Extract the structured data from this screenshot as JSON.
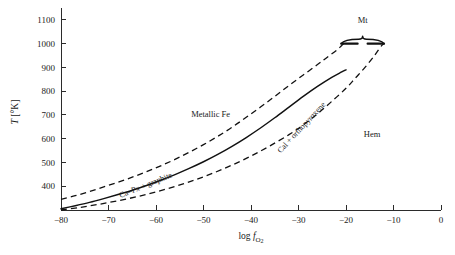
{
  "chart_data": {
    "type": "line",
    "title": "",
    "xlabel": "log f O2",
    "xlabel_parts": {
      "prefix": "log ",
      "italic": "f",
      "sub": "O",
      "sub2": "2"
    },
    "ylabel": "T [°K]",
    "ylabel_parts": {
      "italic": "T",
      "rest": " [°K]"
    },
    "xlim": [
      -80,
      0
    ],
    "ylim": [
      300,
      1150
    ],
    "grid": false,
    "legend_position": "none",
    "xticks": [
      -80,
      -70,
      -60,
      -50,
      -40,
      -30,
      -20,
      -10,
      0
    ],
    "xtick_labels": [
      "−80",
      "−70",
      "−60",
      "−50",
      "−40",
      "−30",
      "−20",
      "−10",
      "0"
    ],
    "yticks": [
      400,
      500,
      600,
      700,
      800,
      900,
      1000,
      1100
    ],
    "ytick_labels": [
      "400",
      "500",
      "600",
      "700",
      "800",
      "900",
      "1000",
      "1100"
    ],
    "series": [
      {
        "name": "upper-boundary",
        "style": "dashed",
        "points": [
          [
            -80,
            345
          ],
          [
            -77,
            360
          ],
          [
            -74,
            378
          ],
          [
            -71,
            397
          ],
          [
            -68,
            417
          ],
          [
            -65,
            438
          ],
          [
            -62,
            461
          ],
          [
            -59,
            486
          ],
          [
            -56,
            513
          ],
          [
            -53,
            543
          ],
          [
            -50,
            575
          ],
          [
            -47,
            610
          ],
          [
            -44,
            648
          ],
          [
            -41,
            690
          ],
          [
            -38,
            733
          ],
          [
            -35,
            778
          ],
          [
            -32,
            824
          ],
          [
            -29,
            868
          ],
          [
            -26,
            912
          ],
          [
            -24,
            942
          ],
          [
            -22,
            972
          ],
          [
            -21,
            990
          ],
          [
            -20.5,
            1000
          ]
        ]
      },
      {
        "name": "center-curve",
        "style": "solid",
        "points": [
          [
            -80,
            305
          ],
          [
            -77,
            318
          ],
          [
            -74,
            332
          ],
          [
            -71,
            348
          ],
          [
            -68,
            365
          ],
          [
            -65,
            383
          ],
          [
            -62,
            403
          ],
          [
            -59,
            425
          ],
          [
            -56,
            449
          ],
          [
            -53,
            475
          ],
          [
            -50,
            503
          ],
          [
            -47,
            534
          ],
          [
            -44,
            568
          ],
          [
            -41,
            605
          ],
          [
            -38,
            645
          ],
          [
            -35,
            688
          ],
          [
            -32,
            733
          ],
          [
            -29,
            778
          ],
          [
            -26,
            820
          ],
          [
            -23,
            858
          ],
          [
            -21,
            880
          ],
          [
            -20,
            890
          ]
        ]
      },
      {
        "name": "lower-boundary",
        "style": "dashed",
        "points": [
          [
            -80,
            300
          ],
          [
            -76,
            311
          ],
          [
            -72,
            324
          ],
          [
            -68,
            339
          ],
          [
            -64,
            356
          ],
          [
            -60,
            376
          ],
          [
            -56,
            399
          ],
          [
            -52,
            425
          ],
          [
            -48,
            455
          ],
          [
            -44,
            489
          ],
          [
            -40,
            527
          ],
          [
            -36,
            570
          ],
          [
            -32,
            617
          ],
          [
            -29,
            658
          ],
          [
            -26,
            705
          ],
          [
            -23,
            757
          ],
          [
            -20,
            812
          ],
          [
            -18,
            856
          ],
          [
            -16,
            900
          ],
          [
            -14,
            950
          ],
          [
            -12.5,
            992
          ],
          [
            -12,
            1000
          ]
        ]
      }
    ],
    "annotations": [
      {
        "name": "metallic-fe",
        "text": "Metallic Fe",
        "x": -48.5,
        "y": 690,
        "rotation": 0
      },
      {
        "name": "hem",
        "text": "Hem",
        "x": -14.5,
        "y": 607,
        "rotation": 0
      },
      {
        "name": "mt",
        "text": "Mt",
        "x": -16.5,
        "y": 1085,
        "rotation": 0
      },
      {
        "name": "ca-px-graphite",
        "text": "Ca–Px + graphite",
        "x": -62,
        "y": 395,
        "rotation": -22
      },
      {
        "name": "cal-orthopyroxene",
        "text": "Cal + orthopyroxene",
        "x": -29,
        "y": 640,
        "rotation": -47
      }
    ],
    "brace": {
      "name": "mt-brace",
      "label": "Mt",
      "x_left": -21,
      "x_right": -12,
      "y": 1000
    }
  }
}
